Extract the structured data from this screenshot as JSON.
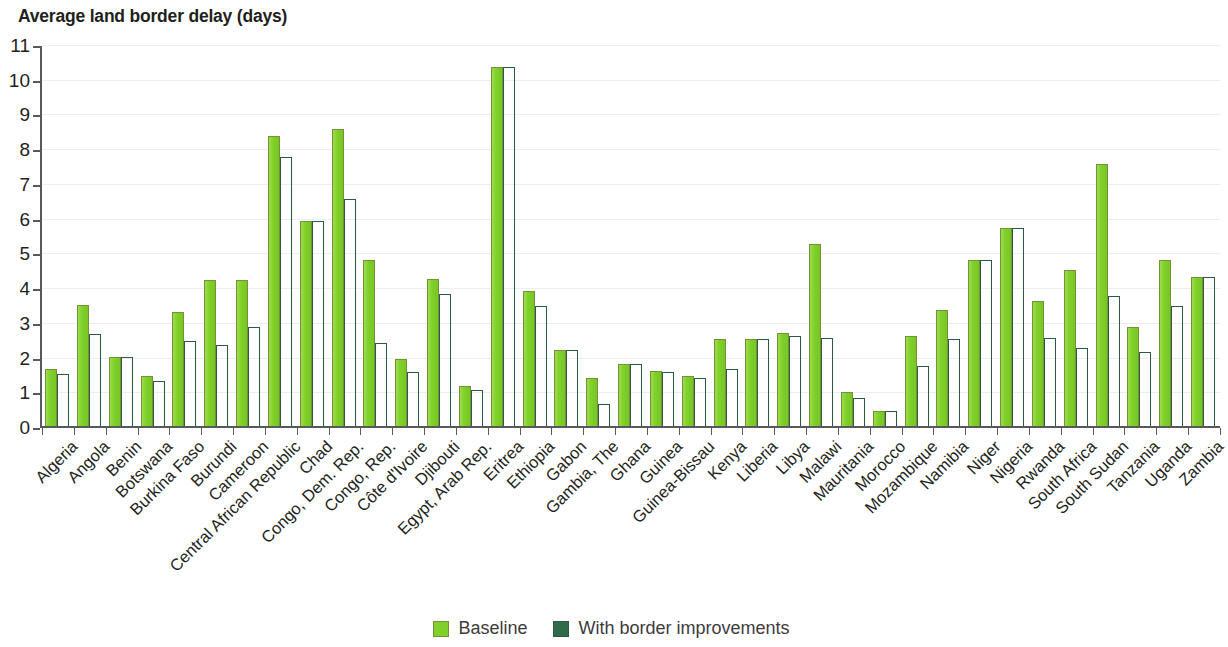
{
  "chart_data": {
    "type": "bar",
    "title": "Average land border delay (days)",
    "xlabel": "",
    "ylabel": "",
    "ylim": [
      0,
      11
    ],
    "ytick_labels": [
      "0",
      "1",
      "2",
      "3",
      "4",
      "5",
      "6",
      "7",
      "8",
      "9",
      "10",
      "11"
    ],
    "grid": true,
    "legend_position": "bottom",
    "colors": {
      "baseline": "#7fd02a",
      "improved": "#2f6b49"
    },
    "categories": [
      "Algeria",
      "Angola",
      "Benin",
      "Botswana",
      "Burkina Faso",
      "Burundi",
      "Cameroon",
      "Central African Republic",
      "Chad",
      "Congo, Dem. Rep.",
      "Congo, Rep.",
      "Côte d'Ivoire",
      "Djibouti",
      "Egypt, Arab Rep.",
      "Eritrea",
      "Ethiopia",
      "Gabon",
      "Gambia, The",
      "Ghana",
      "Guinea",
      "Guinea-Bissau",
      "Kenya",
      "Liberia",
      "Libya",
      "Malawi",
      "Mauritania",
      "Morocco",
      "Mozambique",
      "Namibia",
      "Niger",
      "Nigeria",
      "Rwanda",
      "South Africa",
      "South Sudan",
      "Tanzania",
      "Uganda",
      "Zambia"
    ],
    "series": [
      {
        "name": "Baseline",
        "values": [
          1.7,
          3.55,
          2.05,
          1.5,
          3.35,
          4.25,
          4.25,
          8.4,
          5.95,
          8.6,
          4.85,
          2.0,
          4.3,
          1.2,
          10.4,
          3.95,
          2.25,
          1.45,
          1.85,
          1.65,
          1.5,
          2.55,
          2.55,
          2.75,
          5.3,
          1.05,
          0.5,
          2.65,
          3.4,
          4.85,
          5.75,
          3.65,
          4.55,
          7.6,
          2.9,
          4.85,
          4.35
        ]
      },
      {
        "name": "With border improvements",
        "values": [
          1.55,
          2.7,
          2.05,
          1.35,
          2.5,
          2.4,
          2.9,
          7.8,
          5.95,
          6.6,
          2.45,
          1.6,
          3.85,
          1.1,
          10.4,
          3.5,
          2.25,
          0.7,
          1.85,
          1.6,
          1.45,
          1.7,
          2.55,
          2.65,
          2.6,
          0.85,
          0.5,
          1.8,
          2.55,
          4.85,
          5.75,
          2.6,
          2.3,
          3.8,
          2.2,
          3.5,
          4.35
        ]
      }
    ]
  },
  "legend": {
    "items": [
      {
        "label": "Baseline",
        "color": "#7fd02a"
      },
      {
        "label": "With border improvements",
        "color": "#2f6b49"
      }
    ]
  }
}
